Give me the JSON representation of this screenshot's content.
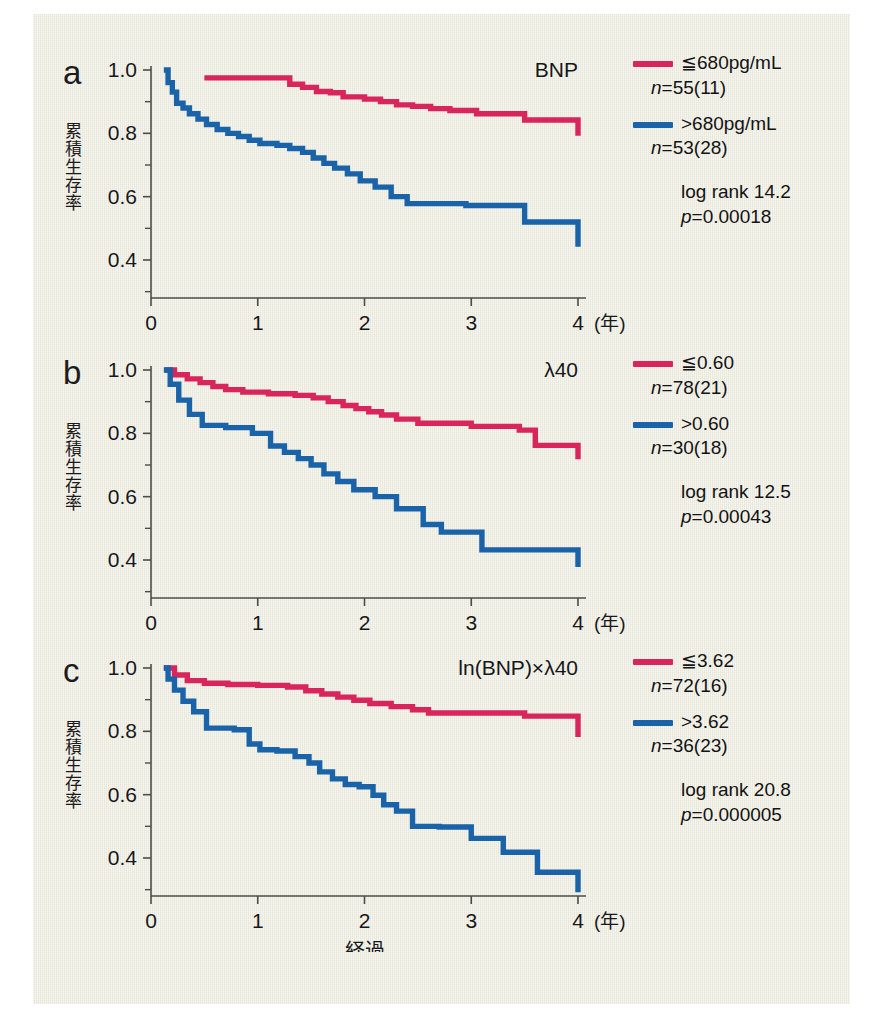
{
  "figure": {
    "background_color": "#efeee2",
    "series_colors": {
      "low": "#d8265c",
      "high": "#1a63a8"
    },
    "axis": {
      "y_label": "累積生存率",
      "y_ticks": [
        "1.0",
        "0.8",
        "0.6",
        "0.4"
      ],
      "x_ticks": [
        "0",
        "1",
        "2",
        "3",
        "4"
      ],
      "x_unit": "(年)",
      "x_label": "経過"
    }
  },
  "panels": [
    {
      "letter": "a",
      "title": "BNP",
      "legend": {
        "low_label": "≦680pg/mL",
        "low_n": "n=55(11)",
        "high_label": ">680pg/mL",
        "high_n": "n=53(28)",
        "logrank": "log rank 14.2",
        "pvalue": "p=0.00018"
      }
    },
    {
      "letter": "b",
      "title": "λ40",
      "legend": {
        "low_label": "≦0.60",
        "low_n": "n=78(21)",
        "high_label": ">0.60",
        "high_n": "n=30(18)",
        "logrank": "log rank 12.5",
        "pvalue": "p=0.00043"
      }
    },
    {
      "letter": "c",
      "title": "ln(BNP)×λ40",
      "legend": {
        "low_label": "≦3.62",
        "low_n": "n=72(16)",
        "high_label": ">3.62",
        "high_n": "n=36(23)",
        "logrank": "log rank 20.8",
        "pvalue": "p=0.000005"
      }
    }
  ],
  "chart_data": [
    {
      "type": "line",
      "panel": "a",
      "title": "BNP",
      "xlabel": "経過 (年)",
      "ylabel": "累積生存率",
      "xlim": [
        0,
        4
      ],
      "ylim": [
        0.28,
        1.0
      ],
      "yticks": [
        0.4,
        0.6,
        0.8,
        1.0
      ],
      "xticks": [
        0,
        1,
        2,
        3,
        4
      ],
      "grid": false,
      "legend_position": "right",
      "series": [
        {
          "name": "≦680pg/mL",
          "n": 55,
          "events": 11,
          "color": "#d8265c",
          "x": [
            0.5,
            0.5,
            1.3,
            1.42,
            1.55,
            1.68,
            1.8,
            2.0,
            2.15,
            2.3,
            2.45,
            2.62,
            2.8,
            3.05,
            3.5,
            4.0
          ],
          "y": [
            0.975,
            0.975,
            0.955,
            0.945,
            0.932,
            0.928,
            0.915,
            0.908,
            0.9,
            0.89,
            0.885,
            0.878,
            0.872,
            0.862,
            0.842,
            0.792
          ]
        },
        {
          "name": ">680pg/mL",
          "n": 53,
          "events": 28,
          "color": "#1a63a8",
          "x": [
            0.12,
            0.16,
            0.2,
            0.24,
            0.3,
            0.36,
            0.44,
            0.52,
            0.62,
            0.72,
            0.82,
            0.92,
            1.02,
            1.18,
            1.3,
            1.42,
            1.52,
            1.62,
            1.72,
            1.84,
            1.96,
            2.1,
            2.25,
            2.4,
            2.95,
            3.5,
            4.0
          ],
          "y": [
            1.0,
            0.96,
            0.93,
            0.895,
            0.88,
            0.862,
            0.845,
            0.828,
            0.812,
            0.8,
            0.79,
            0.778,
            0.768,
            0.762,
            0.752,
            0.74,
            0.722,
            0.705,
            0.69,
            0.672,
            0.65,
            0.63,
            0.6,
            0.578,
            0.572,
            0.52,
            0.442
          ]
        }
      ]
    },
    {
      "type": "line",
      "panel": "b",
      "title": "λ40",
      "xlabel": "経過 (年)",
      "ylabel": "累積生存率",
      "xlim": [
        0,
        4
      ],
      "ylim": [
        0.28,
        1.0
      ],
      "yticks": [
        0.4,
        0.6,
        0.8,
        1.0
      ],
      "xticks": [
        0,
        1,
        2,
        3,
        4
      ],
      "grid": false,
      "legend_position": "right",
      "series": [
        {
          "name": "≦0.60",
          "n": 78,
          "events": 21,
          "color": "#d8265c",
          "x": [
            0.13,
            0.22,
            0.34,
            0.46,
            0.58,
            0.7,
            0.86,
            1.1,
            1.35,
            1.52,
            1.66,
            1.8,
            1.92,
            2.04,
            2.16,
            2.3,
            2.5,
            3.0,
            3.45,
            3.6,
            4.0
          ],
          "y": [
            1.0,
            0.985,
            0.972,
            0.96,
            0.948,
            0.938,
            0.93,
            0.925,
            0.92,
            0.912,
            0.9,
            0.888,
            0.878,
            0.868,
            0.858,
            0.845,
            0.832,
            0.822,
            0.81,
            0.762,
            0.718
          ]
        },
        {
          "name": ">0.60",
          "n": 30,
          "events": 18,
          "color": "#1a63a8",
          "x": [
            0.12,
            0.18,
            0.26,
            0.36,
            0.48,
            0.7,
            0.95,
            1.12,
            1.25,
            1.38,
            1.5,
            1.62,
            1.75,
            1.9,
            2.1,
            2.3,
            2.55,
            2.72,
            3.1,
            4.0
          ],
          "y": [
            1.0,
            0.955,
            0.905,
            0.86,
            0.825,
            0.818,
            0.8,
            0.76,
            0.74,
            0.72,
            0.7,
            0.672,
            0.648,
            0.622,
            0.6,
            0.562,
            0.512,
            0.488,
            0.432,
            0.378
          ]
        }
      ]
    },
    {
      "type": "line",
      "panel": "c",
      "title": "ln(BNP)×λ40",
      "xlabel": "経過 (年)",
      "ylabel": "累積生存率",
      "xlim": [
        0,
        4
      ],
      "ylim": [
        0.28,
        1.0
      ],
      "yticks": [
        0.4,
        0.6,
        0.8,
        1.0
      ],
      "xticks": [
        0,
        1,
        2,
        3,
        4
      ],
      "grid": false,
      "legend_position": "right",
      "series": [
        {
          "name": "≦3.62",
          "n": 72,
          "events": 16,
          "color": "#d8265c",
          "x": [
            0.12,
            0.22,
            0.34,
            0.5,
            0.72,
            1.0,
            1.28,
            1.45,
            1.6,
            1.75,
            1.9,
            2.05,
            2.25,
            2.45,
            2.6,
            3.5,
            4.0
          ],
          "y": [
            1.0,
            0.978,
            0.96,
            0.952,
            0.948,
            0.945,
            0.94,
            0.928,
            0.918,
            0.908,
            0.898,
            0.888,
            0.878,
            0.868,
            0.858,
            0.848,
            0.782
          ]
        },
        {
          "name": ">3.62",
          "n": 36,
          "events": 23,
          "color": "#1a63a8",
          "x": [
            0.12,
            0.16,
            0.22,
            0.3,
            0.4,
            0.52,
            0.78,
            0.92,
            1.02,
            1.18,
            1.35,
            1.48,
            1.58,
            1.7,
            1.82,
            1.95,
            2.08,
            2.18,
            2.3,
            2.45,
            2.7,
            3.0,
            3.3,
            3.62,
            4.0
          ],
          "y": [
            1.0,
            0.965,
            0.93,
            0.895,
            0.862,
            0.81,
            0.805,
            0.76,
            0.742,
            0.738,
            0.72,
            0.7,
            0.672,
            0.65,
            0.632,
            0.625,
            0.598,
            0.568,
            0.548,
            0.5,
            0.498,
            0.462,
            0.418,
            0.355,
            0.292
          ]
        }
      ]
    }
  ]
}
